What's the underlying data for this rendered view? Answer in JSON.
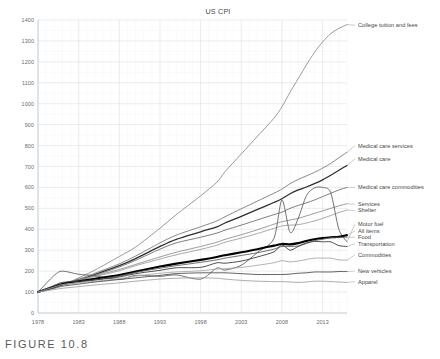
{
  "figure": {
    "caption": "FIGURE 10.8"
  },
  "chart_data": {
    "type": "line",
    "title": "US CPI",
    "xlabel": "",
    "ylabel": "",
    "xlim": [
      1978,
      2016
    ],
    "ylim": [
      0,
      1400
    ],
    "grid": true,
    "legend_position": "right-inline-labels",
    "y_ticks": [
      0,
      100,
      200,
      300,
      400,
      500,
      600,
      700,
      800,
      900,
      1000,
      1100,
      1200,
      1300,
      1400
    ],
    "x_ticks": [
      1978,
      1983,
      1988,
      1993,
      1998,
      2003,
      2008,
      2013
    ],
    "x": [
      1978,
      1980,
      1981,
      1983,
      1985,
      1988,
      1990,
      1993,
      1995,
      1998,
      2000,
      2001,
      2003,
      2005,
      2007,
      2008,
      2009,
      2010,
      2011,
      2012,
      2013,
      2014,
      2015,
      2016
    ],
    "series": [
      {
        "name": "College tuition and fees",
        "color": "#8f8f8f",
        "width": 0.9,
        "label_y": 1375,
        "values": [
          100,
          122,
          135,
          168,
          205,
          270,
          315,
          405,
          470,
          560,
          625,
          675,
          760,
          845,
          930,
          985,
          1055,
          1120,
          1185,
          1245,
          1295,
          1335,
          1360,
          1378
        ]
      },
      {
        "name": "Medical care services",
        "color": "#7d7d7d",
        "width": 0.9,
        "label_y": 800,
        "values": [
          100,
          125,
          138,
          162,
          190,
          235,
          272,
          335,
          372,
          412,
          440,
          460,
          498,
          535,
          572,
          592,
          618,
          638,
          655,
          672,
          692,
          715,
          742,
          768
        ]
      },
      {
        "name": "Medical care",
        "color": "#2f2f2f",
        "width": 1.3,
        "label_y": 735,
        "values": [
          100,
          124,
          136,
          158,
          184,
          226,
          260,
          318,
          352,
          388,
          412,
          430,
          462,
          495,
          528,
          546,
          570,
          588,
          602,
          618,
          636,
          658,
          682,
          705
        ]
      },
      {
        "name": "Medical care commodities",
        "color": "#6f6f6f",
        "width": 0.9,
        "label_y": 600,
        "values": [
          100,
          122,
          134,
          155,
          180,
          220,
          252,
          305,
          335,
          362,
          382,
          396,
          420,
          445,
          470,
          482,
          500,
          514,
          526,
          540,
          556,
          572,
          588,
          600
        ]
      },
      {
        "name": "Services",
        "color": "#8a8a8a",
        "width": 0.85,
        "label_y": 520,
        "values": [
          100,
          126,
          140,
          158,
          178,
          208,
          232,
          268,
          290,
          318,
          338,
          352,
          374,
          398,
          424,
          436,
          444,
          452,
          464,
          476,
          488,
          500,
          512,
          522
        ]
      },
      {
        "name": "Shelter",
        "color": "#9a9a9a",
        "width": 0.85,
        "label_y": 490,
        "values": [
          100,
          128,
          142,
          156,
          174,
          202,
          226,
          258,
          278,
          304,
          324,
          338,
          358,
          380,
          404,
          416,
          420,
          422,
          430,
          440,
          452,
          466,
          480,
          492
        ]
      },
      {
        "name": "Motor fuel",
        "color": "#5a5a5a",
        "width": 0.85,
        "label_y": 425,
        "values": [
          100,
          180,
          200,
          185,
          178,
          160,
          180,
          175,
          182,
          162,
          215,
          205,
          228,
          290,
          355,
          540,
          385,
          452,
          560,
          598,
          600,
          575,
          400,
          340
        ]
      },
      {
        "name": "All items",
        "color": "#000000",
        "width": 2.1,
        "label_y": 392,
        "values": [
          100,
          126,
          139,
          152,
          164,
          182,
          198,
          222,
          236,
          254,
          268,
          276,
          290,
          305,
          322,
          330,
          328,
          334,
          344,
          352,
          358,
          362,
          364,
          372
        ]
      },
      {
        "name": "Food",
        "color": "#555555",
        "width": 0.85,
        "label_y": 362,
        "values": [
          100,
          124,
          134,
          146,
          158,
          176,
          194,
          214,
          226,
          242,
          254,
          262,
          275,
          288,
          305,
          318,
          318,
          320,
          332,
          346,
          352,
          360,
          362,
          362
        ]
      },
      {
        "name": "Transportation",
        "color": "#3a3a3a",
        "width": 0.9,
        "label_y": 332,
        "values": [
          100,
          132,
          146,
          152,
          158,
          172,
          188,
          204,
          216,
          218,
          240,
          238,
          248,
          268,
          292,
          325,
          300,
          318,
          335,
          342,
          340,
          340,
          322,
          318
        ]
      },
      {
        "name": "Commodities",
        "color": "#a5a5a5",
        "width": 0.85,
        "label_y": 278,
        "values": [
          100,
          124,
          136,
          145,
          152,
          164,
          176,
          190,
          196,
          202,
          210,
          212,
          218,
          228,
          240,
          250,
          244,
          248,
          256,
          262,
          262,
          262,
          254,
          252
        ]
      },
      {
        "name": "New vehicles",
        "color": "#4f4f4f",
        "width": 0.9,
        "label_y": 200,
        "values": [
          100,
          118,
          128,
          138,
          148,
          160,
          168,
          180,
          188,
          192,
          192,
          192,
          188,
          184,
          184,
          184,
          186,
          190,
          192,
          196,
          196,
          196,
          198,
          198
        ]
      },
      {
        "name": "Apparel",
        "color": "#9e9e9e",
        "width": 0.85,
        "label_y": 150,
        "values": [
          100,
          112,
          118,
          126,
          134,
          144,
          152,
          162,
          166,
          168,
          166,
          162,
          156,
          152,
          150,
          150,
          148,
          146,
          148,
          152,
          152,
          150,
          148,
          146
        ]
      }
    ]
  }
}
